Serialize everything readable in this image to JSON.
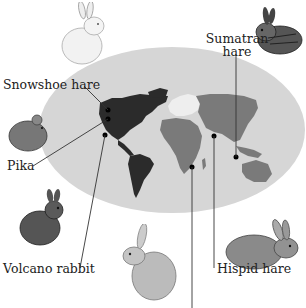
{
  "colors": {
    "ocean": "#d6d6d6",
    "lagomorph_range_dark": "#2b2b2b",
    "lagomorph_range_mid": "#7a7a7a",
    "non_range_light": "#eeeeee",
    "leader_line": "#333333",
    "label_text": "#222222"
  },
  "map": {
    "projection": "oval-world-map",
    "dots": [
      {
        "id": "snowshoe-hare",
        "region": "North America (north)"
      },
      {
        "id": "pika",
        "region": "North America (west)"
      },
      {
        "id": "volcano-rabbit",
        "region": "Mexico"
      },
      {
        "id": "hispid-hare",
        "region": "South Asia"
      },
      {
        "id": "sumatran-hare",
        "region": "Sumatra"
      },
      {
        "id": "african-hare",
        "region": "East Africa"
      }
    ]
  },
  "labels": {
    "snowshoe_hare": "Snowshoe hare",
    "pika": "Pika",
    "volcano_rabbit": "Volcano rabbit",
    "sumatran_hare_line1": "Sumatran",
    "sumatran_hare_line2": "hare",
    "hispid_hare": "Hispid hare"
  },
  "animals": [
    {
      "name": "snowshoe-hare",
      "position": "top-left"
    },
    {
      "name": "sumatran-hare",
      "position": "top-right"
    },
    {
      "name": "pika",
      "position": "middle-left"
    },
    {
      "name": "volcano-rabbit",
      "position": "lower-left"
    },
    {
      "name": "african-hare",
      "position": "bottom-center"
    },
    {
      "name": "hispid-hare",
      "position": "bottom-right"
    }
  ]
}
